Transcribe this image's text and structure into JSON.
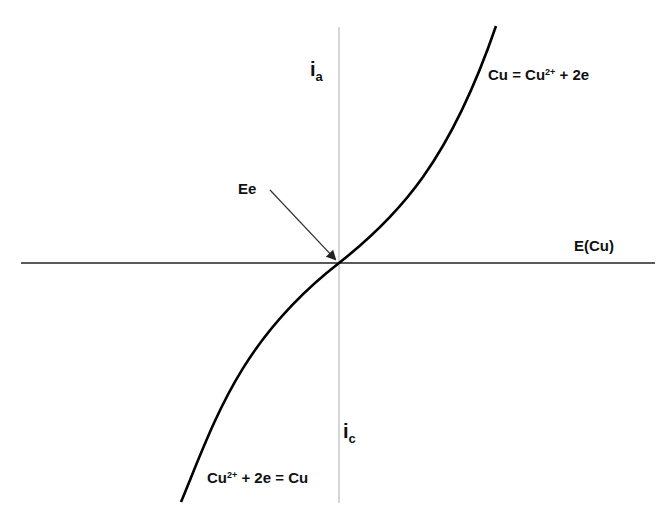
{
  "diagram": {
    "type": "polarization-curve",
    "axes": {
      "vertical_top_label": {
        "symbol": "i",
        "subscript": "a"
      },
      "vertical_bottom_label": {
        "symbol": "i",
        "subscript": "c"
      },
      "horizontal_label": "E(Cu)"
    },
    "annotations": {
      "equilibrium_point": "Ee",
      "anodic_reaction": {
        "pre": "Cu = Cu",
        "sup": "2+",
        "post": " + 2e"
      },
      "cathodic_reaction": {
        "pre": "Cu",
        "sup": "2+",
        "post": " + 2e = Cu"
      }
    },
    "colors": {
      "curve": "#000000",
      "horizontal_axis": "#222222",
      "vertical_axis": "#bbbbbb",
      "arrow": "#333333",
      "text": "#111111"
    }
  }
}
